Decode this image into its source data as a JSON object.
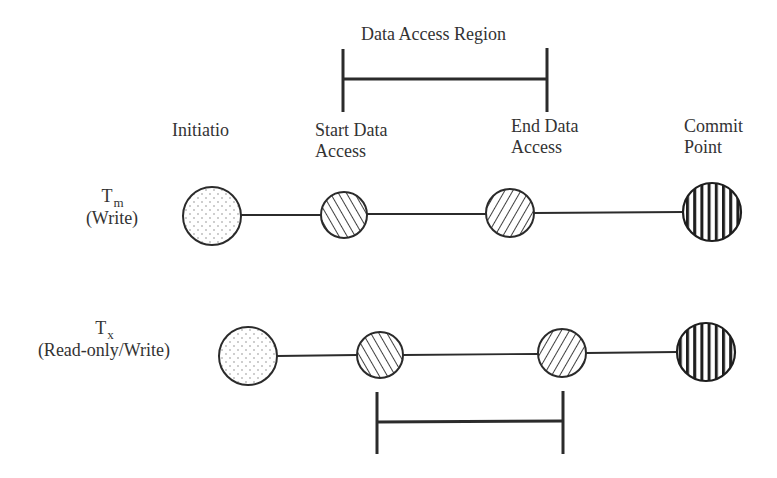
{
  "diagram": {
    "region_label": "Data Access Region",
    "stages": {
      "initiation": "Initiatio",
      "start_line1": "Start Data",
      "start_line2": "Access",
      "end_line1": "End Data",
      "end_line2": "Access",
      "commit_line1": "Commit",
      "commit_line2": "Point"
    },
    "rows": [
      {
        "symbol": "T",
        "subscript": "m",
        "mode": "(Write)"
      },
      {
        "symbol": "T",
        "subscript": "x",
        "mode": "(Read-only/Write)"
      }
    ],
    "colors": {
      "stroke": "#2b2b2b",
      "text": "#333333",
      "background": "#ffffff"
    }
  }
}
